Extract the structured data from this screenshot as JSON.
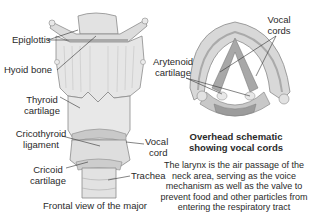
{
  "diagram": {
    "frontal_view": {
      "caption": "Frontal view of the major",
      "labels": {
        "epiglottis": "Epiglottis",
        "hyoid_bone": "Hyoid bone",
        "thyroid_cartilage": [
          "Thyroid",
          "cartilage"
        ],
        "cricothyroid_ligament": [
          "Cricothyroid",
          "ligament"
        ],
        "vocal_cord": [
          "Vocal",
          "cord"
        ],
        "cricoid_cartilage": [
          "Cricoid",
          "cartilage"
        ],
        "trachea": "Trachea"
      }
    },
    "overhead_view": {
      "title": [
        "Overhead schematic",
        "showing vocal cords"
      ],
      "labels": {
        "vocal_cords": [
          "Vocal",
          "cords"
        ],
        "arytenoid_cartilage": [
          "Arytenoid",
          "cartilage"
        ]
      }
    },
    "description": [
      "The larynx is the air passage of the",
      "neck area, serving as the voice",
      "mechanism as well as the valve to",
      "prevent food and other particles from",
      "entering the respiratory tract"
    ],
    "colors": {
      "tissue_light": "#e4e4e4",
      "tissue_mid": "#cfcfcf",
      "tissue_dark": "#a8a8a8",
      "outline": "#7a7a7a",
      "leader": "#333333"
    }
  }
}
